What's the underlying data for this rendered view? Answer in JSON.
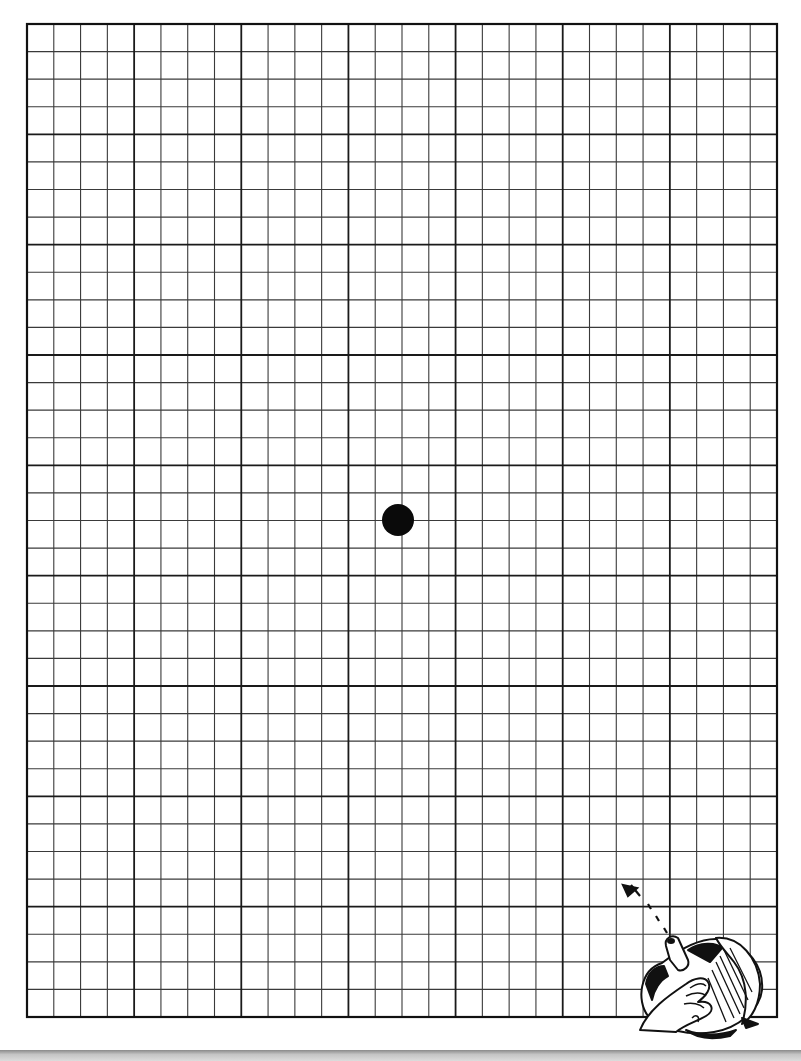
{
  "page": {
    "background": "#ffffff",
    "ink_color": "#1a1a1a"
  },
  "grid": {
    "left": 27,
    "top": 24,
    "right": 777,
    "bottom": 1017,
    "columns": 28,
    "rows": 36,
    "major_every": 4,
    "minor_line_color": "#3a3a3a",
    "major_line_color": "#1a1a1a",
    "border_color": "#111111"
  },
  "focus_dot": {
    "cx": 398,
    "cy": 520,
    "r": 16,
    "color": "#0a0a0a"
  },
  "illustration": {
    "icon": "hands-holding-grid-corner-icon",
    "arrow": "dashed-arrow-up-left-icon"
  },
  "bottom_bar": {
    "color": "#a0a0a0"
  }
}
